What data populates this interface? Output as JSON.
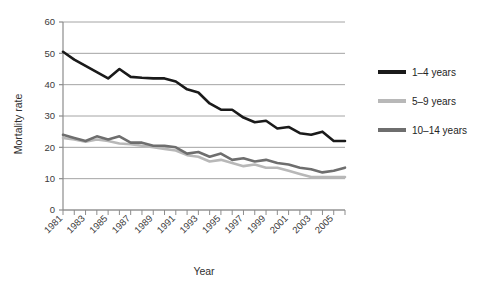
{
  "chart_data": {
    "type": "line",
    "title": "",
    "xlabel": "Year",
    "ylabel": "Mortality rate",
    "xlim": [
      1981,
      2006
    ],
    "ylim": [
      0,
      60
    ],
    "yticks": [
      0,
      10,
      20,
      30,
      40,
      50,
      60
    ],
    "xticks": [
      1981,
      1983,
      1985,
      1987,
      1989,
      1991,
      1993,
      1995,
      1997,
      1999,
      2001,
      2003,
      2005
    ],
    "x": [
      1981,
      1982,
      1983,
      1984,
      1985,
      1986,
      1987,
      1988,
      1989,
      1990,
      1991,
      1992,
      1993,
      1994,
      1995,
      1996,
      1997,
      1998,
      1999,
      2000,
      2001,
      2002,
      2003,
      2004,
      2005,
      2006
    ],
    "grid": "horizontal",
    "legend_position": "right",
    "series": [
      {
        "name": "1–4 years",
        "color": "#1a1a1a",
        "values": [
          50.5,
          48.0,
          46.0,
          44.0,
          42.0,
          45.0,
          42.5,
          42.2,
          42.0,
          42.0,
          41.0,
          38.5,
          37.5,
          34.0,
          32.0,
          32.0,
          29.5,
          28.0,
          28.5,
          26.0,
          26.5,
          24.5,
          24.0,
          25.0,
          22.0,
          22.0
        ]
      },
      {
        "name": "5–9 years",
        "color": "#b8b8b8",
        "values": [
          23.0,
          22.5,
          21.8,
          22.5,
          22.0,
          21.2,
          21.0,
          20.5,
          20.0,
          19.5,
          19.0,
          17.5,
          17.0,
          15.5,
          16.0,
          15.0,
          14.0,
          14.5,
          13.5,
          13.5,
          12.5,
          11.5,
          10.5,
          10.5,
          10.5,
          10.5
        ]
      },
      {
        "name": "10–14 years",
        "color": "#6e6e6e",
        "values": [
          24.0,
          23.0,
          22.0,
          23.5,
          22.5,
          23.5,
          21.5,
          21.5,
          20.5,
          20.5,
          20.0,
          18.0,
          18.5,
          17.0,
          18.0,
          16.0,
          16.5,
          15.5,
          16.0,
          15.0,
          14.5,
          13.5,
          13.0,
          12.0,
          12.5,
          13.5
        ]
      }
    ]
  },
  "axes": {
    "ylabel": "Mortality rate",
    "xlabel": "Year",
    "yticks": [
      "60",
      "50",
      "40",
      "30",
      "20",
      "10",
      "0"
    ],
    "xticks": [
      "1981",
      "1983",
      "1985",
      "1987",
      "1989",
      "1991",
      "1993",
      "1995",
      "1997",
      "1999",
      "2001",
      "2003",
      "2005"
    ]
  },
  "legend": {
    "items": [
      {
        "label": "1–4 years",
        "color": "#1a1a1a"
      },
      {
        "label": "5–9 years",
        "color": "#b8b8b8"
      },
      {
        "label": "10–14 years",
        "color": "#6e6e6e"
      }
    ]
  },
  "colors": {
    "axis": "#8c8c8c",
    "grid": "#9a9a9a",
    "text": "#2a2a2a",
    "background": "#ffffff"
  }
}
